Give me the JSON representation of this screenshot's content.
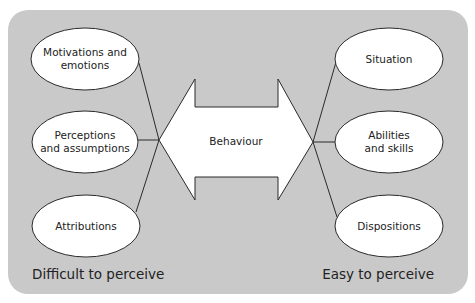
{
  "diagram": {
    "background_color": "#c9c9c9",
    "center": {
      "label": "Behaviour",
      "shape": "double-headed-arrow"
    },
    "left_nodes": [
      {
        "lines": [
          "Motivations and",
          "emotions"
        ]
      },
      {
        "lines": [
          "Perceptions",
          "and assumptions"
        ]
      },
      {
        "lines": [
          "Attributions"
        ]
      }
    ],
    "right_nodes": [
      {
        "lines": [
          "Situation"
        ]
      },
      {
        "lines": [
          "Abilities",
          "and skills"
        ]
      },
      {
        "lines": [
          "Dispositions"
        ]
      }
    ],
    "left_caption": "Difficult to perceive",
    "right_caption": "Easy to perceive"
  }
}
